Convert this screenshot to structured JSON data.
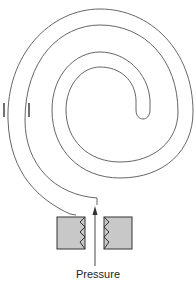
{
  "diagram": {
    "type": "bourdon-spiral-pressure-gauge",
    "labels": {
      "pressure": "Pressure"
    },
    "parts": [
      "spiral-tube",
      "socket-fitting",
      "threaded-connection",
      "pressure-inlet-arrow",
      "tick-marks"
    ],
    "colors": {
      "line": "#555555",
      "fitting_fill": "#c8c8c8",
      "fitting_stroke": "#333333"
    }
  }
}
